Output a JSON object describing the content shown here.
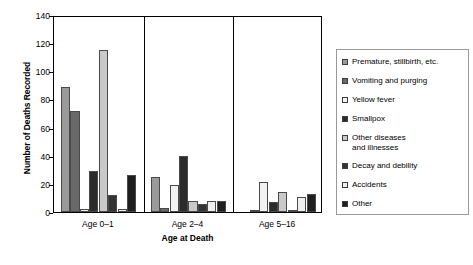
{
  "chart_data": {
    "type": "bar",
    "title": "",
    "xlabel": "Age at Death",
    "ylabel": "Number of Deaths Recorded",
    "categories": [
      "Age 0–1",
      "Age 2–4",
      "Age 5–16"
    ],
    "ylim": [
      0,
      140
    ],
    "yticks": [
      0,
      20,
      40,
      60,
      80,
      100,
      120,
      140
    ],
    "grid": false,
    "legend_position": "right",
    "series": [
      {
        "name": "Premature, stillbirth, etc.",
        "color": "#9a9a9a",
        "values": [
          89,
          25,
          0
        ]
      },
      {
        "name": "Vomiting and purging",
        "color": "#696969",
        "values": [
          72,
          3,
          1
        ]
      },
      {
        "name": "Yellow fever",
        "color": "#f2f2f2",
        "values": [
          2,
          19,
          21
        ]
      },
      {
        "name": "Smallpox",
        "color": "#2b2b2b",
        "values": [
          29,
          40,
          7
        ]
      },
      {
        "name": "Other diseases\nand illnesses",
        "color": "#c9c9c9",
        "values": [
          115,
          8,
          14
        ]
      },
      {
        "name": "Decay and debility",
        "color": "#333333",
        "values": [
          12,
          6,
          1
        ]
      },
      {
        "name": "Accidents",
        "color": "#efefef",
        "values": [
          2,
          8,
          11
        ]
      },
      {
        "name": "Other",
        "color": "#1f1f1f",
        "values": [
          26,
          8,
          13
        ]
      }
    ]
  }
}
